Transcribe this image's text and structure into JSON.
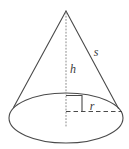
{
  "figure": {
    "name": "cone-geometry-diagram",
    "background_color": "#ffffff",
    "stroke_color": "#4a4a4a",
    "label_color": "#3a3a3a"
  },
  "labels": {
    "slant_height": "s",
    "height": "h",
    "radius": "r"
  },
  "geometry": {
    "apex": {
      "x": 66,
      "y": 11
    },
    "base_center": {
      "x": 66,
      "y": 118
    },
    "base_rx": 57,
    "base_ry": 25,
    "left_contact": {
      "x": 14,
      "y": 107
    },
    "right_contact": {
      "x": 118,
      "y": 108
    },
    "radius_end": {
      "x": 122,
      "y": 112
    },
    "right_angle_size": 16
  },
  "label_positions": {
    "slant_height": {
      "x": 96,
      "y": 56
    },
    "height": {
      "x": 72,
      "y": 73
    },
    "radius": {
      "x": 92,
      "y": 110
    }
  }
}
